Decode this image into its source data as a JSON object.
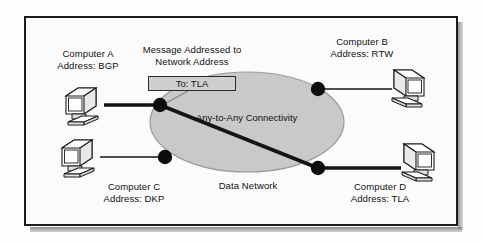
{
  "diagram": {
    "title_hidden": "",
    "network": {
      "cloud_label": "Any-to-Any Connectivity",
      "network_label": "Data Network",
      "cloud_fill": "#c9c9c9",
      "cloud_stroke": "#8c8c8c"
    },
    "message": {
      "caption_line1": "Message Addressed to",
      "caption_line2": "Network Address",
      "box_text": "To: TLA",
      "box_fill": "#cfcfcf"
    },
    "nodes": [
      {
        "id": "node-top-left",
        "cx": 160,
        "cy": 105,
        "r": 7
      },
      {
        "id": "node-top-right",
        "cx": 318,
        "cy": 89,
        "r": 7
      },
      {
        "id": "node-bottom-left",
        "cx": 165,
        "cy": 157,
        "r": 7
      },
      {
        "id": "node-bottom-right",
        "cx": 318,
        "cy": 168,
        "r": 7
      }
    ],
    "computers": [
      {
        "id": "computer-a",
        "name": "Computer A",
        "address": "Address: BGP",
        "label_x": 46,
        "label_y": 50,
        "icon_x": 62,
        "icon_y": 86,
        "facing": "right"
      },
      {
        "id": "computer-b",
        "name": "Computer B",
        "address": "Address: RTW",
        "label_x": 322,
        "label_y": 38,
        "icon_x": 388,
        "icon_y": 68,
        "facing": "left"
      },
      {
        "id": "computer-c",
        "name": "Computer C",
        "address": "Address: DKP",
        "label_x": 90,
        "label_y": 185,
        "icon_x": 58,
        "icon_y": 138,
        "facing": "right"
      },
      {
        "id": "computer-d",
        "name": "Computer D",
        "address": "Address: TLA",
        "label_x": 338,
        "label_y": 185,
        "icon_x": 398,
        "icon_y": 142,
        "facing": "left"
      }
    ],
    "links": [
      {
        "id": "link-a-to-network",
        "x1": 104,
        "y1": 105,
        "x2": 160,
        "y2": 105,
        "weight": "thick"
      },
      {
        "id": "link-b-to-network",
        "x1": 318,
        "y1": 89,
        "x2": 392,
        "y2": 89,
        "weight": "thin"
      },
      {
        "id": "link-c-to-network",
        "x1": 100,
        "y1": 157,
        "x2": 165,
        "y2": 157,
        "weight": "thin"
      },
      {
        "id": "link-d-to-network",
        "x1": 318,
        "y1": 168,
        "x2": 400,
        "y2": 168,
        "weight": "thick"
      },
      {
        "id": "link-path-across-network",
        "x1": 160,
        "y1": 105,
        "x2": 318,
        "y2": 168,
        "weight": "thick"
      }
    ]
  }
}
